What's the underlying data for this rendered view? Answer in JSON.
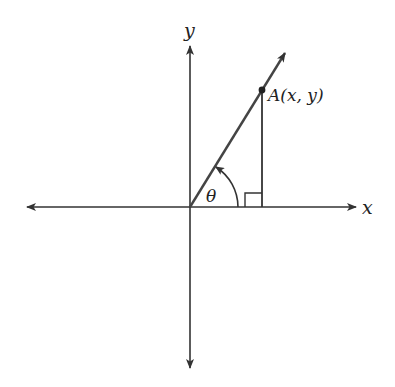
{
  "diagram": {
    "type": "coordinate-plane-angle",
    "colors": {
      "axis": "#333333",
      "ray": "#444444",
      "background": "#ffffff"
    },
    "labels": {
      "x_axis": "x",
      "y_axis": "y",
      "angle": "θ",
      "point": "A(x, y)"
    },
    "origin": [
      190,
      207
    ],
    "point_A": [
      262,
      90
    ],
    "features": [
      "x-axis with arrows both ends",
      "y-axis with arrows both ends",
      "ray from origin through A",
      "vertical drop from A to x-axis",
      "right-angle marker",
      "counterclockwise angle arc theta"
    ]
  }
}
